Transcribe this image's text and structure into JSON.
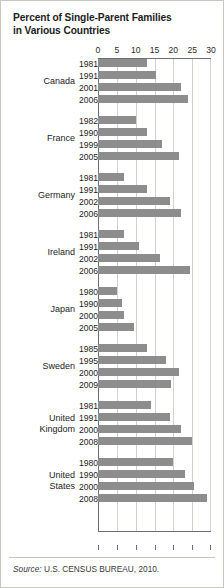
{
  "title_line1": "Percent of Single-Parent Families",
  "title_line2": "in Various Countries",
  "source_label": "Source:",
  "source_text": "U.S. CENSUS BUREAU, 2010.",
  "colors": {
    "bar": "#8d8d8d",
    "grid": "#d3d1cc",
    "axis": "#6e6e6e",
    "text": "#1c1c1c",
    "border": "#c9c6c0"
  },
  "chart_data": {
    "type": "bar",
    "orientation": "horizontal",
    "title": "Percent of Single-Parent Families in Various Countries",
    "xlabel": "",
    "ylabel": "",
    "xlim": [
      0,
      30
    ],
    "xticks": [
      0,
      5,
      10,
      15,
      20,
      25,
      30
    ],
    "tick_labels": [
      "0",
      "5",
      "10",
      "15",
      "20",
      "25",
      "30"
    ],
    "grid": true,
    "legend": "none",
    "source": "Source: U.S. CENSUS BUREAU, 2010.",
    "groups": [
      {
        "name": "Canada",
        "items": [
          {
            "year": "1981",
            "value": 13.0
          },
          {
            "year": "1991",
            "value": 15.5
          },
          {
            "year": "2001",
            "value": 22.0
          },
          {
            "year": "2006",
            "value": 24.0
          }
        ]
      },
      {
        "name": "France",
        "items": [
          {
            "year": "1982",
            "value": 10.0
          },
          {
            "year": "1990",
            "value": 13.0
          },
          {
            "year": "1999",
            "value": 17.0
          },
          {
            "year": "2005",
            "value": 21.5
          }
        ]
      },
      {
        "name": "Germany",
        "items": [
          {
            "year": "1981",
            "value": 7.0
          },
          {
            "year": "1991",
            "value": 13.0
          },
          {
            "year": "2002",
            "value": 19.0
          },
          {
            "year": "2006",
            "value": 22.0
          }
        ]
      },
      {
        "name": "Ireland",
        "items": [
          {
            "year": "1981",
            "value": 7.0
          },
          {
            "year": "1991",
            "value": 11.0
          },
          {
            "year": "2002",
            "value": 16.5
          },
          {
            "year": "2006",
            "value": 24.5
          }
        ]
      },
      {
        "name": "Japan",
        "items": [
          {
            "year": "1980",
            "value": 5.0
          },
          {
            "year": "1990",
            "value": 6.5
          },
          {
            "year": "2000",
            "value": 7.0
          },
          {
            "year": "2005",
            "value": 9.5
          }
        ]
      },
      {
        "name": "Sweden",
        "items": [
          {
            "year": "1985",
            "value": 13.0
          },
          {
            "year": "1995",
            "value": 18.0
          },
          {
            "year": "2000",
            "value": 21.5
          },
          {
            "year": "2009",
            "value": 19.5
          }
        ]
      },
      {
        "name": "United\nKingdom",
        "items": [
          {
            "year": "1981",
            "value": 14.0
          },
          {
            "year": "1991",
            "value": 19.0
          },
          {
            "year": "2000",
            "value": 22.0
          },
          {
            "year": "2008",
            "value": 25.0
          }
        ]
      },
      {
        "name": "United\nStates",
        "items": [
          {
            "year": "1980",
            "value": 20.0
          },
          {
            "year": "1990",
            "value": 23.0
          },
          {
            "year": "2000",
            "value": 25.5
          },
          {
            "year": "2008",
            "value": 29.0
          }
        ]
      }
    ]
  }
}
